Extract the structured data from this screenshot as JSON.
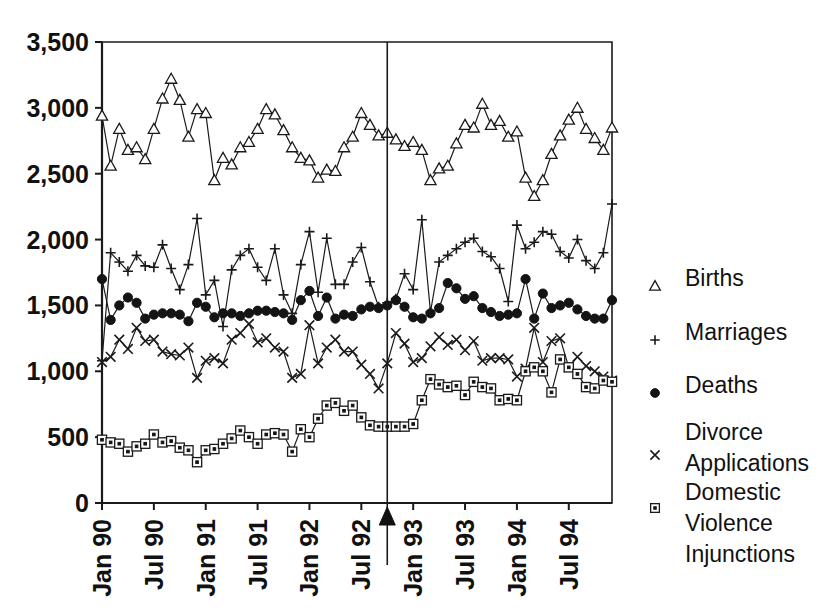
{
  "chart_data": {
    "type": "line",
    "title": "",
    "subtitle": "",
    "xlabel": "",
    "ylabel": "",
    "ylim": [
      0,
      3500
    ],
    "yticks": [
      0,
      500,
      1000,
      1500,
      2000,
      2500,
      3000,
      3500
    ],
    "ytick_labels": [
      "0",
      "500",
      "1,000",
      "1,500",
      "2,000",
      "2,500",
      "3,000",
      "3,500"
    ],
    "grid": false,
    "legend_position": "right",
    "x_start_label": "Jan 90",
    "x_end_label": "Dec 94",
    "x_tick_labels": [
      "Jan 90",
      "Jul 90",
      "Jan 91",
      "Jul 91",
      "Jan 92",
      "Jul 92",
      "Jan 93",
      "Jul 93",
      "Jan 94",
      "Jul 94"
    ],
    "x_tick_indices": [
      0,
      6,
      12,
      18,
      24,
      30,
      36,
      42,
      48,
      54
    ],
    "n_points": 60,
    "annotations": [
      {
        "name": "intervention-marker",
        "type": "vertical-line-with-triangle",
        "x_index": 33,
        "label": ""
      }
    ],
    "series": [
      {
        "name": "Births",
        "marker": "open-triangle",
        "color": "#1a1a1a",
        "values": [
          2940,
          2560,
          2840,
          2680,
          2700,
          2610,
          2840,
          3070,
          3220,
          3060,
          2780,
          2990,
          2960,
          2450,
          2620,
          2570,
          2700,
          2740,
          2840,
          2990,
          2950,
          2830,
          2700,
          2620,
          2600,
          2470,
          2530,
          2520,
          2700,
          2780,
          2960,
          2870,
          2790,
          2810,
          2760,
          2710,
          2740,
          2680,
          2450,
          2540,
          2560,
          2730,
          2870,
          2850,
          3030,
          2870,
          2900,
          2780,
          2820,
          2470,
          2330,
          2450,
          2650,
          2790,
          2910,
          3000,
          2840,
          2770,
          2680,
          2850
        ]
      },
      {
        "name": "Marriages",
        "marker": "plus",
        "color": "#1a1a1a",
        "values": [
          1080,
          1900,
          1830,
          1760,
          1880,
          1800,
          1790,
          1960,
          1780,
          1620,
          1810,
          2160,
          1580,
          1690,
          1340,
          1770,
          1880,
          1930,
          1790,
          1690,
          1930,
          1580,
          1440,
          1810,
          2060,
          1600,
          2010,
          1660,
          1660,
          1830,
          1940,
          1680,
          1490,
          1520,
          1550,
          1740,
          1620,
          2150,
          1450,
          1830,
          1880,
          1930,
          1980,
          2010,
          1910,
          1870,
          1780,
          1530,
          2110,
          1930,
          1980,
          2060,
          2040,
          1910,
          1860,
          2000,
          1840,
          1780,
          1900,
          2270
        ]
      },
      {
        "name": "Deaths",
        "marker": "filled-circle",
        "color": "#141414",
        "values": [
          1700,
          1390,
          1500,
          1560,
          1520,
          1400,
          1430,
          1440,
          1440,
          1430,
          1380,
          1520,
          1490,
          1410,
          1440,
          1440,
          1420,
          1440,
          1460,
          1460,
          1450,
          1440,
          1390,
          1540,
          1610,
          1420,
          1560,
          1400,
          1430,
          1420,
          1470,
          1490,
          1480,
          1500,
          1540,
          1490,
          1410,
          1400,
          1440,
          1480,
          1670,
          1630,
          1550,
          1570,
          1480,
          1450,
          1420,
          1430,
          1440,
          1700,
          1400,
          1590,
          1480,
          1500,
          1520,
          1470,
          1420,
          1400,
          1400,
          1540
        ]
      },
      {
        "name": "Divorce Applications",
        "marker": "cross",
        "color": "#1a1a1a",
        "values": [
          1070,
          1110,
          1240,
          1170,
          1330,
          1230,
          1240,
          1150,
          1130,
          1120,
          1180,
          950,
          1080,
          1100,
          1060,
          1240,
          1290,
          1360,
          1220,
          1250,
          1180,
          1150,
          950,
          980,
          1350,
          1060,
          1180,
          1240,
          1150,
          1150,
          1050,
          980,
          870,
          1060,
          1290,
          1210,
          1070,
          1100,
          1190,
          1260,
          1200,
          1240,
          1160,
          1230,
          1080,
          1100,
          1100,
          1090,
          960,
          1020,
          1330,
          1070,
          1230,
          1250,
          1030,
          1110,
          1040,
          1000,
          960,
          930
        ]
      },
      {
        "name": "Domestic Violence Injunctions",
        "marker": "square-dot",
        "color": "#1a1a1a",
        "values": [
          480,
          460,
          450,
          390,
          430,
          450,
          520,
          460,
          470,
          420,
          400,
          310,
          400,
          410,
          450,
          490,
          550,
          500,
          450,
          520,
          530,
          520,
          390,
          560,
          500,
          640,
          740,
          760,
          700,
          740,
          650,
          590,
          580,
          580,
          580,
          580,
          600,
          780,
          940,
          900,
          880,
          890,
          820,
          920,
          880,
          870,
          780,
          790,
          780,
          1000,
          1030,
          1000,
          840,
          1090,
          1030,
          980,
          880,
          870,
          930,
          920
        ]
      }
    ]
  },
  "legend": {
    "items": [
      {
        "label": "Births",
        "marker": "open-triangle"
      },
      {
        "label": "Marriages",
        "marker": "plus"
      },
      {
        "label": "Deaths",
        "marker": "filled-circle"
      },
      {
        "label": "Divorce",
        "label2": "Applications",
        "marker": "cross"
      },
      {
        "label": "Domestic",
        "label2": "Violence",
        "label3": "Injunctions",
        "marker": "square-dot"
      }
    ]
  }
}
